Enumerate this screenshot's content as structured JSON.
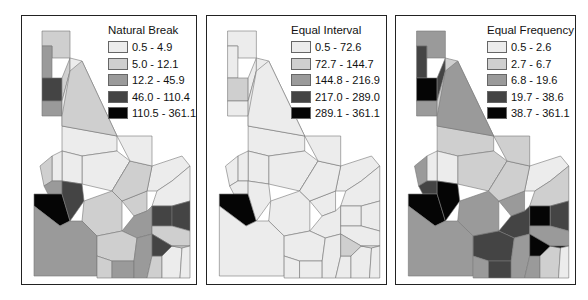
{
  "palette": [
    "#ececec",
    "#cfcfcf",
    "#9a9a9a",
    "#444444",
    "#050505"
  ],
  "panels": [
    {
      "title": "Natural Break",
      "classes": [
        {
          "label": "0.5 - 4.9",
          "color": "#ececec"
        },
        {
          "label": "5.0 - 12.1",
          "color": "#cfcfcf"
        },
        {
          "label": "12.2 - 45.9",
          "color": "#9a9a9a"
        },
        {
          "label": "46.0 - 110.4",
          "color": "#444444"
        },
        {
          "label": "110.5 - 361.1",
          "color": "#050505"
        }
      ]
    },
    {
      "title": "Equal Interval",
      "classes": [
        {
          "label": "0.5 - 72.6",
          "color": "#ececec"
        },
        {
          "label": "72.7 - 144.7",
          "color": "#cfcfcf"
        },
        {
          "label": "144.8 - 216.9",
          "color": "#9a9a9a"
        },
        {
          "label": "217.0 - 289.0",
          "color": "#444444"
        },
        {
          "label": "289.1 - 361.1",
          "color": "#050505"
        }
      ]
    },
    {
      "title": "Equal Frequency",
      "classes": [
        {
          "label": "0.5 - 2.6",
          "color": "#ececec"
        },
        {
          "label": "2.7 - 6.7",
          "color": "#cfcfcf"
        },
        {
          "label": "6.8 - 19.6",
          "color": "#9a9a9a"
        },
        {
          "label": "19.7 - 38.6",
          "color": "#444444"
        },
        {
          "label": "38.7 - 361.1",
          "color": "#050505"
        }
      ]
    }
  ],
  "county_classes": {
    "natural_break": [
      1,
      2,
      3,
      2,
      1,
      0,
      0,
      0,
      0,
      0,
      0,
      1,
      2,
      4,
      3,
      1,
      2,
      1,
      0,
      0,
      2,
      1,
      1,
      2,
      2,
      1,
      0,
      3,
      3,
      1,
      3,
      1,
      0,
      1,
      0,
      1
    ],
    "equal_interval": [
      0,
      0,
      1,
      0,
      0,
      0,
      0,
      0,
      0,
      0,
      0,
      0,
      0,
      4,
      0,
      0,
      0,
      0,
      0,
      0,
      0,
      0,
      0,
      0,
      0,
      0,
      0,
      0,
      0,
      0,
      1,
      0,
      0,
      0,
      0,
      0
    ],
    "equal_frequency": [
      2,
      3,
      4,
      2,
      3,
      1,
      1,
      1,
      0,
      0,
      0,
      2,
      3,
      4,
      4,
      2,
      2,
      2,
      0,
      1,
      3,
      3,
      2,
      3,
      2,
      2,
      1,
      4,
      3,
      2,
      4,
      4,
      0,
      1,
      1,
      2
    ]
  }
}
